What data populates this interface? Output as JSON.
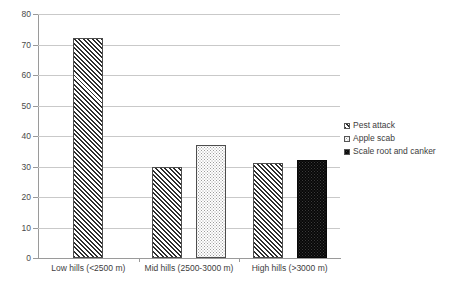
{
  "chart_data": {
    "type": "bar",
    "title": "",
    "subtitle": "",
    "xlabel": "",
    "ylabel": "",
    "ylim": [
      0,
      80
    ],
    "ytick_step": 10,
    "yticks": [
      "80",
      "70",
      "60",
      "50",
      "40",
      "30",
      "20",
      "10",
      "0"
    ],
    "grid": true,
    "legend_position": "right",
    "categories": [
      "Low hills (<2500 m)",
      "Mid hills (2500-3000 m)",
      "High hills (>3000 m)"
    ],
    "series": [
      {
        "name": "Pest attack",
        "pattern": "diagonal-hatch",
        "color": "#2e2e2e",
        "values": [
          72,
          30,
          31
        ]
      },
      {
        "name": "Apple scab",
        "pattern": "light-dots",
        "color": "#9b9b9b",
        "values": [
          null,
          37,
          null
        ]
      },
      {
        "name": "Scale root and canker",
        "pattern": "solid-black-dots",
        "color": "#080808",
        "values": [
          null,
          null,
          32
        ]
      }
    ]
  },
  "legend": {
    "items": [
      {
        "label": "Pest attack"
      },
      {
        "label": "Apple scab"
      },
      {
        "label": "Scale root and canker"
      }
    ]
  },
  "axes": {
    "y": {
      "ticks": [
        "80",
        "70",
        "60",
        "50",
        "40",
        "30",
        "20",
        "10",
        "0"
      ]
    },
    "x": {
      "ticks": [
        "Low hills (<2500 m)",
        "Mid hills (2500-3000 m)",
        "High hills (>3000 m)"
      ]
    }
  },
  "colors": {
    "gridline": "#c9c9c9",
    "axis": "#9a9a9a",
    "text": "#3d3d3d",
    "background": "#ffffff"
  }
}
